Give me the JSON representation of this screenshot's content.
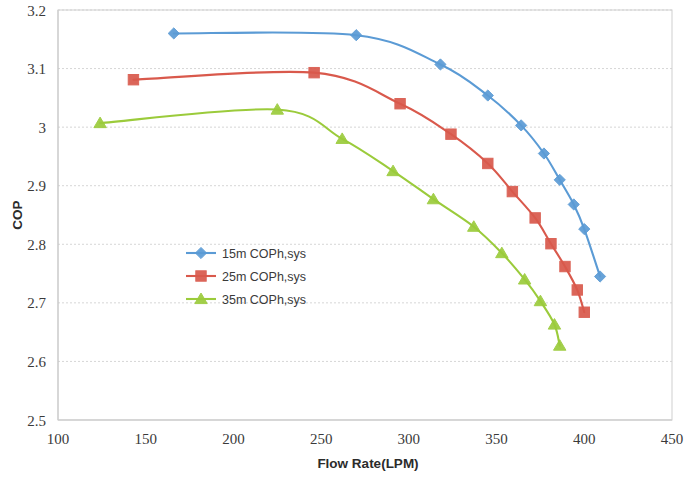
{
  "chart_data": {
    "type": "line",
    "title": "",
    "xlabel": "Flow Rate(LPM)",
    "ylabel": "COP",
    "xlim": [
      100,
      450
    ],
    "ylim": [
      2.5,
      3.2
    ],
    "xticks": [
      100,
      150,
      200,
      250,
      300,
      350,
      400,
      450
    ],
    "yticks": [
      "2.5",
      "2.6",
      "2.7",
      "2.8",
      "2.9",
      "3",
      "3.1",
      "3.2"
    ],
    "grid": true,
    "legend_position": "center-left-inside",
    "series": [
      {
        "name": "15m COPh,sys",
        "color": "#5B9BD5",
        "marker": "diamond",
        "x": [
          166,
          270,
          318,
          345,
          364,
          377,
          386,
          394,
          400,
          409
        ],
        "y": [
          3.16,
          3.157,
          3.107,
          3.054,
          3.003,
          2.955,
          2.91,
          2.868,
          2.826,
          2.745
        ]
      },
      {
        "name": "25m COPh,sys",
        "color": "#D9594C",
        "marker": "square",
        "x": [
          143,
          246,
          295,
          324,
          345,
          359,
          372,
          381,
          389,
          396,
          400
        ],
        "y": [
          3.081,
          3.093,
          3.04,
          2.988,
          2.938,
          2.89,
          2.845,
          2.801,
          2.762,
          2.722,
          2.684
        ]
      },
      {
        "name": "35m COPh,sys",
        "color": "#9BCB3B",
        "marker": "triangle",
        "x": [
          124,
          225,
          262,
          291,
          314,
          337,
          353,
          366,
          375,
          383,
          386
        ],
        "y": [
          3.007,
          3.03,
          2.98,
          2.925,
          2.877,
          2.83,
          2.785,
          2.74,
          2.703,
          2.663,
          2.627
        ]
      }
    ]
  },
  "legend": {
    "items": [
      {
        "label": "15m COPh,sys"
      },
      {
        "label": "25m COPh,sys"
      },
      {
        "label": "35m COPh,sys"
      }
    ]
  },
  "axes": {
    "x_title": "Flow Rate(LPM)",
    "y_title": "COP"
  }
}
